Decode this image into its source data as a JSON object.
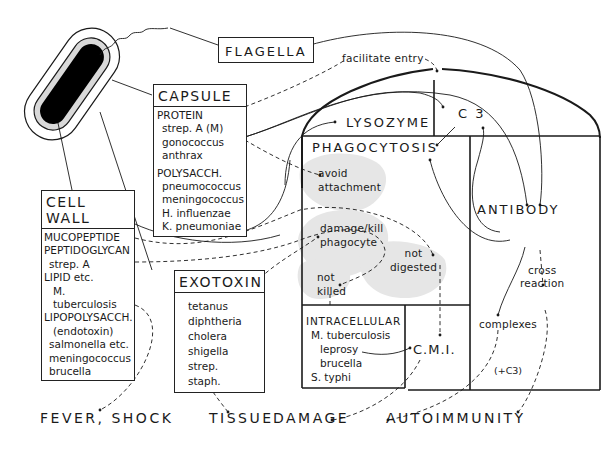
{
  "diagram": {
    "flagella_label": "FLAGELLA",
    "facilitate_entry": "facilitate entry",
    "lysozyme": "LYSOZYME",
    "c3": "C 3",
    "phagocytosis": "PHAGOCYTOSIS",
    "antibody": "ANTIBODY",
    "cross_reaction_1": "cross",
    "cross_reaction_2": "reaction",
    "complexes": "complexes",
    "plus_c3": "(+C3)",
    "cmi": "C.M.I.",
    "avoid_attachment_1": "avoid",
    "avoid_attachment_2": "attachment",
    "damage_kill_1": "damage/kill",
    "damage_kill_2": "phagocyte",
    "not_digested_1": "not",
    "not_digested_2": "digested",
    "not_killed_1": "not",
    "not_killed_2": "killed"
  },
  "capsule": {
    "title": "CAPSULE",
    "protein_header": "PROTEIN",
    "protein_items": [
      "strep. A (M)",
      "gonococcus",
      "anthrax"
    ],
    "polysacch_header": "POLYSACCH.",
    "polysacch_items": [
      "pneumococcus",
      "meningococcus",
      "H. influenzae",
      "K. pneumoniae"
    ]
  },
  "cell_wall": {
    "title": "CELL WALL",
    "rows": [
      "MUCOPEPTIDE",
      "PEPTIDOGLYCAN",
      "strep. A",
      "LIPID etc.",
      "M. tuberculosis",
      "LIPOPOLYSACCH.",
      "(endotoxin)",
      "salmonella etc.",
      "meningococcus",
      "brucella"
    ]
  },
  "exotoxin": {
    "title": "EXOTOXIN",
    "items": [
      "tetanus",
      "diphtheria",
      "cholera",
      "shigella",
      "strep.",
      "staph."
    ]
  },
  "intracellular": {
    "title": "INTRACELLULAR",
    "items": [
      "M. tuberculosis",
      "leprosy",
      "brucella",
      "S. typhi"
    ]
  },
  "outcomes": {
    "fever_shock": "FEVER, SHOCK",
    "tissue": "TISSUE",
    "damage": "DAMAGE",
    "autoimmunity": "AUTOIMMUNITY"
  },
  "colors": {
    "ink": "#1a1a1a",
    "blob": "#e6e6e6",
    "cell_inner": "#d9d9d9",
    "cell_core": "#000000"
  }
}
